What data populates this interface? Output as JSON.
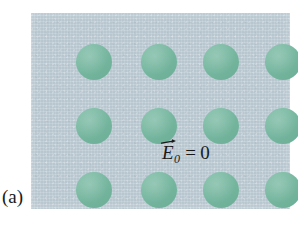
{
  "figure": {
    "panel_caption": "(a)",
    "type": "physics-illustration",
    "colors": {
      "panel_background": "#bfcdd6",
      "atom_fill": "#71b79e",
      "text": "#1a1a1a",
      "page_background": "#ffffff"
    },
    "panel": {
      "x": 31,
      "y": 13,
      "width": 259,
      "height": 196
    },
    "equation": {
      "symbol": "E",
      "subscript": "0",
      "relation": "=",
      "value": "0",
      "vector_arrow": "right-arrow-accent",
      "plain_text": "E⃗₀ = 0"
    },
    "lattice": {
      "rows": 3,
      "columns": 4,
      "count": 12,
      "diameter": 36,
      "row_centers_y": [
        49,
        113,
        177
      ],
      "column_centers_x": [
        63,
        128,
        190,
        252
      ],
      "atoms": [
        {
          "row": 1,
          "col": 1,
          "cx": 63,
          "cy": 49,
          "r": 18
        },
        {
          "row": 1,
          "col": 2,
          "cx": 128,
          "cy": 49,
          "r": 18
        },
        {
          "row": 1,
          "col": 3,
          "cx": 190,
          "cy": 49,
          "r": 18
        },
        {
          "row": 1,
          "col": 4,
          "cx": 252,
          "cy": 49,
          "r": 18
        },
        {
          "row": 2,
          "col": 1,
          "cx": 63,
          "cy": 113,
          "r": 18
        },
        {
          "row": 2,
          "col": 2,
          "cx": 128,
          "cy": 113,
          "r": 18
        },
        {
          "row": 2,
          "col": 3,
          "cx": 190,
          "cy": 113,
          "r": 18
        },
        {
          "row": 2,
          "col": 4,
          "cx": 252,
          "cy": 113,
          "r": 18
        },
        {
          "row": 3,
          "col": 1,
          "cx": 63,
          "cy": 177,
          "r": 18
        },
        {
          "row": 3,
          "col": 2,
          "cx": 128,
          "cy": 177,
          "r": 18
        },
        {
          "row": 3,
          "col": 3,
          "cx": 190,
          "cy": 177,
          "r": 18
        },
        {
          "row": 3,
          "col": 4,
          "cx": 252,
          "cy": 177,
          "r": 18
        }
      ]
    }
  }
}
